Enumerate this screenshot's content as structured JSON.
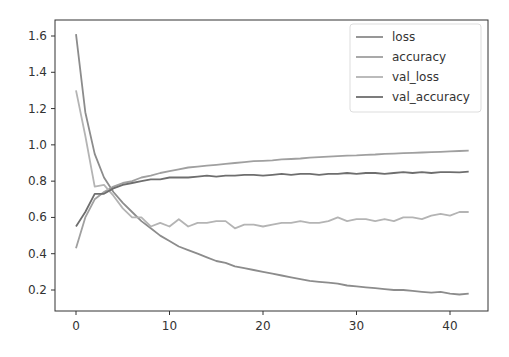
{
  "chart_data": {
    "type": "line",
    "title": "",
    "xlabel": "",
    "ylabel": "",
    "xlim": [
      -2.2,
      44.2
    ],
    "ylim": [
      0.1,
      1.68
    ],
    "grid": false,
    "legend_position": "upper right",
    "x_ticks": [
      0,
      10,
      20,
      30,
      40
    ],
    "x_tick_labels": [
      "0",
      "10",
      "20",
      "30",
      "40"
    ],
    "y_ticks": [
      0.2,
      0.4,
      0.6,
      0.8,
      1.0,
      1.2,
      1.4,
      1.6
    ],
    "y_tick_labels": [
      "0.2",
      "0.4",
      "0.6",
      "0.8",
      "1.0",
      "1.2",
      "1.4",
      "1.6"
    ],
    "x": [
      0,
      1,
      2,
      3,
      4,
      5,
      6,
      7,
      8,
      9,
      10,
      11,
      12,
      13,
      14,
      15,
      16,
      17,
      18,
      19,
      20,
      21,
      22,
      23,
      24,
      25,
      26,
      27,
      28,
      29,
      30,
      31,
      32,
      33,
      34,
      35,
      36,
      37,
      38,
      39,
      40,
      41,
      42
    ],
    "series": [
      {
        "name": "loss",
        "color": "#8c8c8c",
        "values": [
          1.61,
          1.18,
          0.95,
          0.82,
          0.74,
          0.68,
          0.63,
          0.58,
          0.54,
          0.5,
          0.47,
          0.44,
          0.42,
          0.4,
          0.38,
          0.36,
          0.35,
          0.33,
          0.32,
          0.31,
          0.3,
          0.29,
          0.28,
          0.27,
          0.26,
          0.25,
          0.245,
          0.24,
          0.235,
          0.225,
          0.22,
          0.215,
          0.21,
          0.205,
          0.2,
          0.2,
          0.195,
          0.19,
          0.185,
          0.19,
          0.18,
          0.175,
          0.18
        ]
      },
      {
        "name": "accuracy",
        "color": "#a0a0a0",
        "values": [
          0.43,
          0.6,
          0.7,
          0.74,
          0.77,
          0.79,
          0.8,
          0.82,
          0.83,
          0.845,
          0.855,
          0.865,
          0.875,
          0.88,
          0.885,
          0.89,
          0.895,
          0.9,
          0.905,
          0.91,
          0.912,
          0.915,
          0.92,
          0.922,
          0.925,
          0.93,
          0.932,
          0.935,
          0.938,
          0.94,
          0.942,
          0.945,
          0.947,
          0.95,
          0.952,
          0.954,
          0.956,
          0.958,
          0.96,
          0.962,
          0.964,
          0.966,
          0.968
        ]
      },
      {
        "name": "val_loss",
        "color": "#b4b4b4",
        "values": [
          1.3,
          1.05,
          0.77,
          0.78,
          0.72,
          0.65,
          0.6,
          0.6,
          0.55,
          0.57,
          0.55,
          0.59,
          0.55,
          0.57,
          0.57,
          0.58,
          0.58,
          0.54,
          0.56,
          0.56,
          0.55,
          0.56,
          0.57,
          0.57,
          0.58,
          0.57,
          0.57,
          0.58,
          0.6,
          0.58,
          0.59,
          0.59,
          0.58,
          0.59,
          0.58,
          0.6,
          0.6,
          0.59,
          0.61,
          0.62,
          0.61,
          0.63,
          0.63
        ]
      },
      {
        "name": "val_accuracy",
        "color": "#6e6e6e",
        "values": [
          0.55,
          0.63,
          0.73,
          0.73,
          0.76,
          0.78,
          0.79,
          0.8,
          0.81,
          0.81,
          0.82,
          0.82,
          0.82,
          0.825,
          0.83,
          0.825,
          0.83,
          0.83,
          0.835,
          0.835,
          0.83,
          0.835,
          0.84,
          0.835,
          0.84,
          0.84,
          0.835,
          0.84,
          0.84,
          0.845,
          0.84,
          0.845,
          0.845,
          0.84,
          0.845,
          0.85,
          0.845,
          0.85,
          0.845,
          0.85,
          0.85,
          0.848,
          0.852
        ]
      }
    ]
  }
}
